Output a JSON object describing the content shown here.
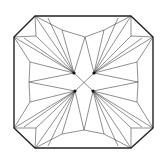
{
  "diagram": {
    "shape": "cut-corner square (octagon)",
    "colors": {
      "background": "#ffffff",
      "lines": "#222222"
    },
    "outline": [
      [
        35,
        16
      ],
      [
        131,
        16
      ],
      [
        153,
        37
      ],
      [
        153,
        128
      ],
      [
        131,
        148
      ],
      [
        35,
        148
      ],
      [
        14,
        128
      ],
      [
        14,
        37
      ]
    ],
    "centers": [
      [
        74,
        73
      ],
      [
        94,
        73
      ],
      [
        75,
        91
      ],
      [
        93,
        91
      ]
    ],
    "center_cross": [
      84,
      82
    ]
  }
}
